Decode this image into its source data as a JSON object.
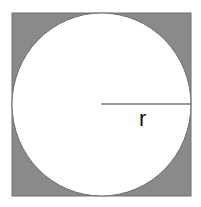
{
  "diagram": {
    "title": "",
    "shapes": {
      "square": {
        "x": 12,
        "y": 13,
        "width": 179,
        "height": 183,
        "fill": "#8a8a8a",
        "stroke": "#6e6e6e"
      },
      "circle": {
        "cx": 101.5,
        "cy": 104.5,
        "rx": 89.5,
        "ry": 91.5,
        "fill": "#ffffff",
        "stroke": "#6e6e6e"
      },
      "radius_line": {
        "x1": 101,
        "y1": 104,
        "x2": 191,
        "y2": 104,
        "stroke": "#333333"
      }
    },
    "labels": {
      "radius": "r"
    }
  }
}
